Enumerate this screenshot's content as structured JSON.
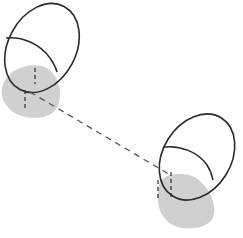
{
  "diagram": {
    "width": 243,
    "height": 238,
    "colors": {
      "background": "#ffffff",
      "stroke": "#2a2a2a",
      "shadow": "#c8c8c8",
      "dash": "#555555"
    },
    "objects": [
      {
        "name": "object-left",
        "ellipse": {
          "cx": 42,
          "cy": 48,
          "rx": 34,
          "ry": 47,
          "rotate": 28
        },
        "shadow_center": [
          30,
          92
        ],
        "axis_marker": [
          33,
          72,
          33,
          110
        ]
      },
      {
        "name": "object-right",
        "ellipse": {
          "cx": 197,
          "cy": 157,
          "rx": 34,
          "ry": 46,
          "rotate": 32
        },
        "shadow_center": [
          188,
          202
        ],
        "axis_marker": [
          171,
          170,
          171,
          200
        ]
      }
    ],
    "connector": {
      "x1": 30,
      "y1": 92,
      "x2": 170,
      "y2": 176,
      "dash": "6 5"
    }
  }
}
